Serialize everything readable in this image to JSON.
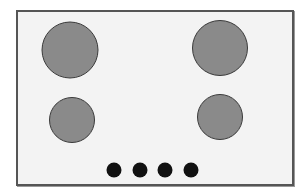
{
  "diagram": {
    "surface": {
      "x": 16,
      "y": 10,
      "width": 278,
      "height": 176,
      "fill": "#f3f3f3",
      "border": "#555555"
    },
    "burners": [
      {
        "id": "burner-top-left",
        "cx": 70,
        "cy": 50,
        "d": 57,
        "fill": "#8a8a8a"
      },
      {
        "id": "burner-top-right",
        "cx": 220,
        "cy": 48,
        "d": 56,
        "fill": "#8a8a8a"
      },
      {
        "id": "burner-bottom-left",
        "cx": 72,
        "cy": 120,
        "d": 46,
        "fill": "#8a8a8a"
      },
      {
        "id": "burner-bottom-right",
        "cx": 220,
        "cy": 117,
        "d": 46,
        "fill": "#8a8a8a"
      }
    ],
    "knobs": [
      {
        "id": "knob-1",
        "cx": 114,
        "cy": 170,
        "d": 15,
        "fill": "#111111"
      },
      {
        "id": "knob-2",
        "cx": 140,
        "cy": 170,
        "d": 15,
        "fill": "#111111"
      },
      {
        "id": "knob-3",
        "cx": 165,
        "cy": 170,
        "d": 15,
        "fill": "#111111"
      },
      {
        "id": "knob-4",
        "cx": 191,
        "cy": 170,
        "d": 15,
        "fill": "#111111"
      }
    ]
  }
}
